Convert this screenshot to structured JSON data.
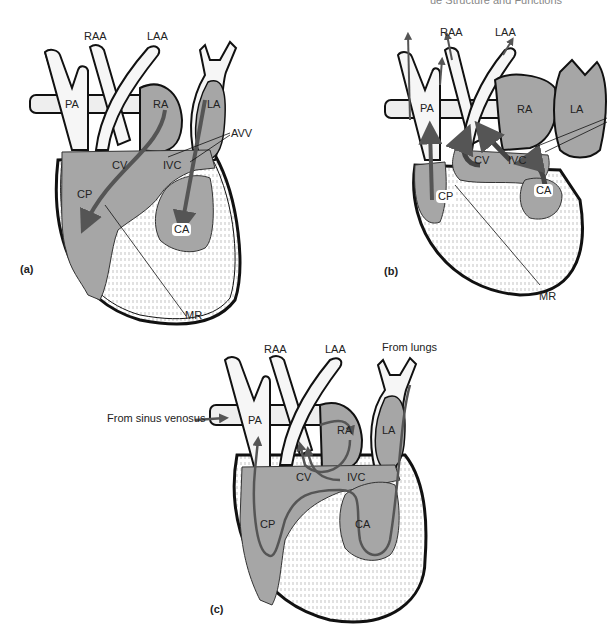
{
  "header": {
    "text": "ue Structure and Functions"
  },
  "colors": {
    "chamber_fill": "#a6a6a6",
    "vessel_fill": "#f6f6f6",
    "outline": "#111111",
    "arrow": "#555555"
  },
  "panels": [
    {
      "id": "a",
      "label": "(a)",
      "structures": [
        "RAA",
        "LAA",
        "PA",
        "RA",
        "LA",
        "AVV",
        "CV",
        "IVC",
        "CP",
        "CA",
        "MR"
      ]
    },
    {
      "id": "b",
      "label": "(b)",
      "structures": [
        "RAA",
        "LAA",
        "PA",
        "RA",
        "LA",
        "CV",
        "IVC",
        "CP",
        "CA",
        "MR"
      ]
    },
    {
      "id": "c",
      "label": "(c)",
      "structures": [
        "RAA",
        "LAA",
        "PA",
        "RA",
        "LA",
        "CV",
        "IVC",
        "CP",
        "CA"
      ],
      "annotations": [
        "From sinus venosus",
        "From lungs"
      ]
    }
  ],
  "labels": {
    "a": {
      "raa": "RAA",
      "laa": "LAA",
      "pa": "PA",
      "ra": "RA",
      "la": "LA",
      "avv": "AVV",
      "cv": "CV",
      "ivc": "IVC",
      "cp": "CP",
      "ca": "CA",
      "mr": "MR",
      "panel": "(a)"
    },
    "b": {
      "raa": "RAA",
      "laa": "LAA",
      "pa": "PA",
      "ra": "RA",
      "la": "LA",
      "cv": "CV",
      "ivc": "IVC",
      "cp": "CP",
      "ca": "CA",
      "mr": "MR",
      "panel": "(b)"
    },
    "c": {
      "raa": "RAA",
      "laa": "LAA",
      "pa": "PA",
      "ra": "RA",
      "la": "LA",
      "cv": "CV",
      "ivc": "IVC",
      "cp": "CP",
      "ca": "CA",
      "panel": "(c)",
      "from_sinus": "From sinus venosus",
      "from_lungs": "From lungs"
    }
  }
}
